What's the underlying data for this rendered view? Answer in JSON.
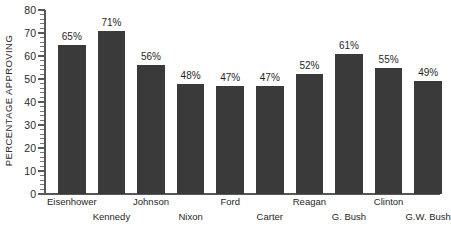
{
  "chart_data": {
    "type": "bar",
    "title": "",
    "xlabel": "",
    "ylabel": "PERCENTAGE APPROVING",
    "ylim": [
      0,
      80
    ],
    "ytick_step": 10,
    "yminor_step": 2,
    "grid": false,
    "legend": null,
    "bar_color": "#3a3a3a",
    "axis_color": "#585858",
    "categories": [
      "Eisenhower",
      "Kennedy",
      "Johnson",
      "Nixon",
      "Ford",
      "Carter",
      "Reagan",
      "G. Bush",
      "Clinton",
      "G.W. Bush"
    ],
    "values": [
      65,
      71,
      56,
      48,
      47,
      47,
      52,
      61,
      55,
      49
    ],
    "data_labels": [
      "65%",
      "71%",
      "56%",
      "48%",
      "47%",
      "47%",
      "52%",
      "61%",
      "55%",
      "49%"
    ],
    "ytick_labels": [
      "0",
      "10",
      "20",
      "30",
      "40",
      "50",
      "60",
      "70",
      "80"
    ],
    "ytick_values": [
      0,
      10,
      20,
      30,
      40,
      50,
      60,
      70,
      80
    ],
    "category_label_rows": [
      0,
      1,
      0,
      1,
      0,
      1,
      0,
      1,
      0,
      1
    ]
  }
}
